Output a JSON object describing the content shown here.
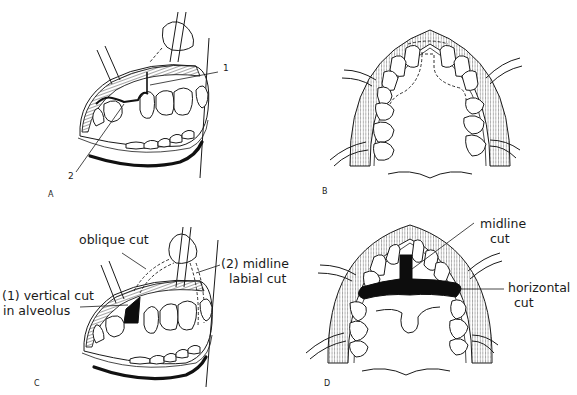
{
  "figure": {
    "panels": [
      {
        "id": "A",
        "label": "A",
        "view": "frontal-oblique view of open mouth with retractors",
        "callouts": [
          {
            "number": "1",
            "text": "1"
          },
          {
            "number": "2",
            "text": "2"
          }
        ]
      },
      {
        "id": "B",
        "label": "B",
        "view": "occlusal view of maxilla with dashed outline of palatal flap"
      },
      {
        "id": "C",
        "label": "C",
        "view": "frontal-oblique view showing cuts",
        "annotations": {
          "oblique": "oblique cut",
          "midline_line1": "(2) midline",
          "midline_line2": "labial cut",
          "vertical_line1": "(1) vertical cut",
          "vertical_line2": "in alveolus"
        }
      },
      {
        "id": "D",
        "label": "D",
        "view": "occlusal view showing T-shaped osteotomy",
        "annotations": {
          "midline_line1": "midline",
          "midline_line2": "cut",
          "horizontal_line1": "horizontal",
          "horizontal_line2": "cut"
        }
      }
    ],
    "colors": {
      "ink": "#1a1a1a",
      "background": "#ffffff",
      "cut_fill": "#0d0d0d"
    }
  }
}
